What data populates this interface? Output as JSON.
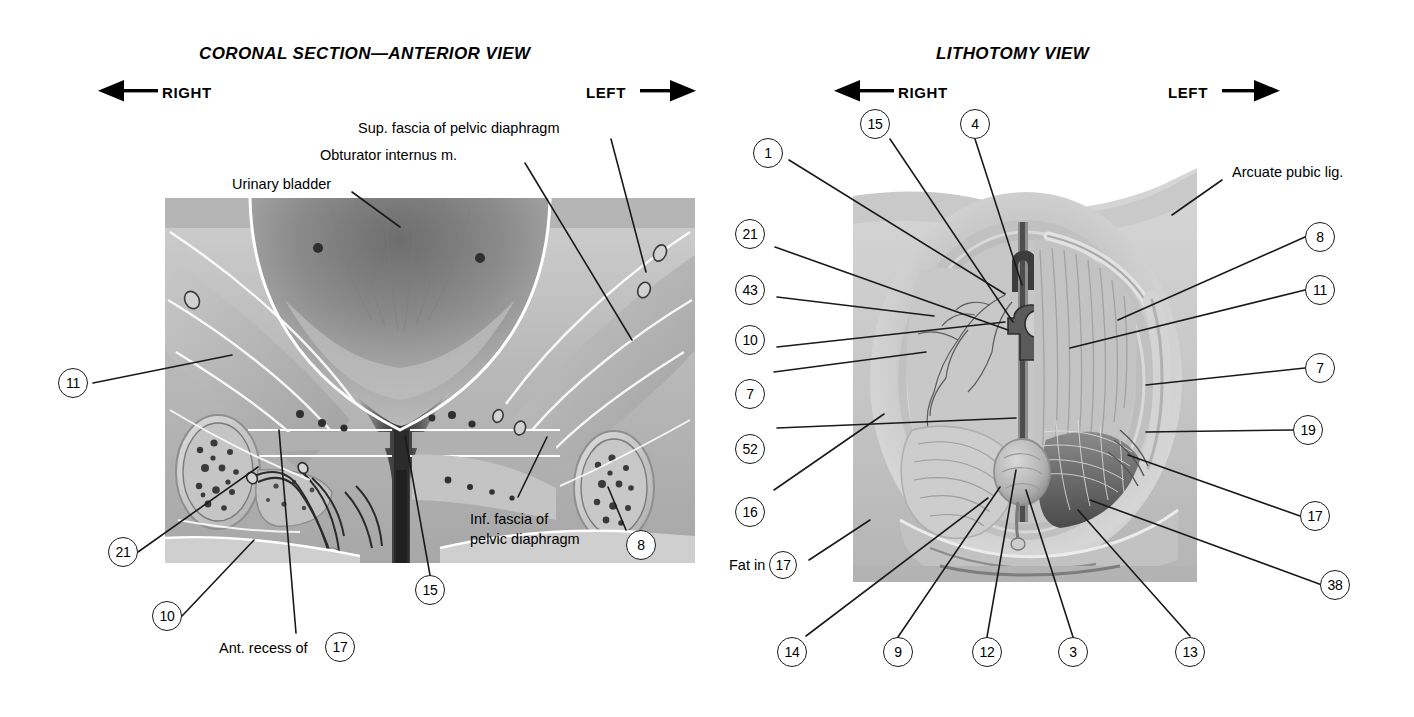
{
  "plate": {
    "background": "#ffffff",
    "ink": "#1a1a1a"
  },
  "panels": [
    {
      "id": "coronal",
      "title": "CORONAL SECTION—ANTERIOR VIEW",
      "orientation": {
        "left_word": "RIGHT",
        "right_word": "LEFT",
        "left_arrow": "arrow-left",
        "right_arrow": "arrow-right"
      },
      "text_labels": [
        {
          "name": "sup-fascia-label",
          "text": "Sup. fascia of pelvic diaphragm"
        },
        {
          "name": "obturator-internus-label",
          "text": "Obturator internus m."
        },
        {
          "name": "urinary-bladder-label",
          "text": "Urinary bladder"
        },
        {
          "name": "inf-fascia-label-line1",
          "text": "Inf. fascia of"
        },
        {
          "name": "inf-fascia-label-line2",
          "text": "pelvic diaphragm"
        },
        {
          "name": "ant-recess-label",
          "text": "Ant. recess of"
        }
      ],
      "callouts": [
        {
          "name": "callout-11",
          "number": "11"
        },
        {
          "name": "callout-21",
          "number": "21"
        },
        {
          "name": "callout-10",
          "number": "10"
        },
        {
          "name": "callout-17",
          "number": "17"
        },
        {
          "name": "callout-15",
          "number": "15"
        },
        {
          "name": "callout-8",
          "number": "8"
        }
      ]
    },
    {
      "id": "lithotomy",
      "title": "LITHOTOMY VIEW",
      "orientation": {
        "left_word": "RIGHT",
        "right_word": "LEFT",
        "left_arrow": "arrow-left",
        "right_arrow": "arrow-right"
      },
      "text_labels": [
        {
          "name": "arcuate-pubic-lig-label",
          "text": "Arcuate pubic lig."
        },
        {
          "name": "fat-in-label",
          "text": "Fat in"
        }
      ],
      "callouts_top": [
        {
          "name": "callout-15",
          "number": "15"
        },
        {
          "name": "callout-4",
          "number": "4"
        }
      ],
      "callouts_left": [
        {
          "name": "callout-1",
          "number": "1"
        },
        {
          "name": "callout-21",
          "number": "21"
        },
        {
          "name": "callout-43",
          "number": "43"
        },
        {
          "name": "callout-10",
          "number": "10"
        },
        {
          "name": "callout-7",
          "number": "7"
        },
        {
          "name": "callout-52",
          "number": "52"
        },
        {
          "name": "callout-16",
          "number": "16"
        },
        {
          "name": "callout-17",
          "number": "17"
        }
      ],
      "callouts_right": [
        {
          "name": "callout-8",
          "number": "8"
        },
        {
          "name": "callout-11",
          "number": "11"
        },
        {
          "name": "callout-7",
          "number": "7"
        },
        {
          "name": "callout-19",
          "number": "19"
        },
        {
          "name": "callout-17",
          "number": "17"
        },
        {
          "name": "callout-38",
          "number": "38"
        }
      ],
      "callouts_bottom": [
        {
          "name": "callout-14",
          "number": "14"
        },
        {
          "name": "callout-9",
          "number": "9"
        },
        {
          "name": "callout-12",
          "number": "12"
        },
        {
          "name": "callout-3",
          "number": "3"
        },
        {
          "name": "callout-13",
          "number": "13"
        }
      ]
    }
  ]
}
